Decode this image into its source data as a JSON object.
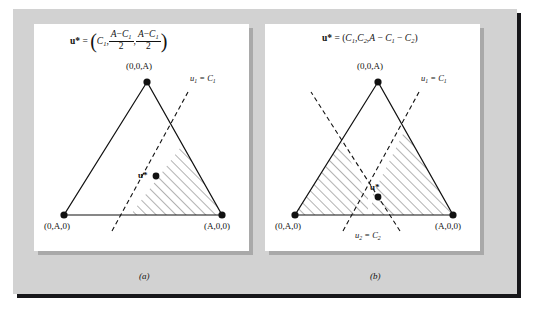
{
  "figure": {
    "background_color": "#d2d2d2",
    "panel_color": "#ffffff",
    "shadow_color": "#17171a",
    "ink_color": "#111111"
  },
  "panels": [
    {
      "id": "a",
      "caption": "(a)",
      "formula": {
        "lhs": "u*",
        "equals": "=",
        "open_paren": "(",
        "term1": "C",
        "term1_sub": "1",
        "comma1": ",",
        "frac1_num_a": "A",
        "frac1_num_minus": "−",
        "frac1_num_b": "C",
        "frac1_num_b_sub": "1",
        "frac1_den": "2",
        "comma2": ",",
        "frac2_num_a": "A",
        "frac2_num_minus": "−",
        "frac2_num_b": "C",
        "frac2_num_b_sub": "1",
        "frac2_den": "2",
        "close_paren": ")",
        "plain": "u* = (C1, (A − C1)/2, (A − C1)/2)"
      },
      "vertices": [
        {
          "name": "apex",
          "label": "(0,0,A)",
          "x": 147,
          "y": 82
        },
        {
          "name": "bottom-left",
          "label": "(0,A,0)",
          "x": 64,
          "y": 215
        },
        {
          "name": "bottom-right",
          "label": "(A,0,0)",
          "x": 222,
          "y": 215
        }
      ],
      "dashed_lines": [
        {
          "name": "u1-constraint",
          "label_u": "u",
          "label_sub": "1",
          "label_eq": "=",
          "label_c": "C",
          "label_c_sub": "1",
          "plain": "u1 = C1"
        }
      ],
      "optimum_point": {
        "label": "u*",
        "x": 150,
        "y": 175
      },
      "hatched_regions": 1
    },
    {
      "id": "b",
      "caption": "(b)",
      "formula": {
        "lhs": "u*",
        "equals": "=",
        "open_paren": "(",
        "term1": "C",
        "term1_sub": "1",
        "comma1": ",",
        "term2": "C",
        "term2_sub": "2",
        "comma2": ",",
        "term3_a": "A",
        "term3_minus1": "−",
        "term3_b": "C",
        "term3_b_sub": "1",
        "term3_minus2": "−",
        "term3_c": "C",
        "term3_c_sub": "2",
        "close_paren": ")",
        "plain": "u* = (C1, C2, A − C1 − C2)"
      },
      "vertices": [
        {
          "name": "apex",
          "label": "(0,0,A)",
          "x": 378,
          "y": 82
        },
        {
          "name": "bottom-left",
          "label": "(0,A,0)",
          "x": 295,
          "y": 215
        },
        {
          "name": "bottom-right",
          "label": "(A,0,0)",
          "x": 453,
          "y": 215
        }
      ],
      "dashed_lines": [
        {
          "name": "u1-constraint",
          "label_u": "u",
          "label_sub": "1",
          "label_eq": "=",
          "label_c": "C",
          "label_c_sub": "1",
          "plain": "u1 = C1"
        },
        {
          "name": "u2-constraint",
          "label_u": "u",
          "label_sub": "2",
          "label_eq": "=",
          "label_c": "C",
          "label_c_sub": "2",
          "plain": "u2 = C2"
        }
      ],
      "optimum_point": {
        "label": "u*",
        "x": 372,
        "y": 196
      },
      "hatched_regions": 2
    }
  ]
}
